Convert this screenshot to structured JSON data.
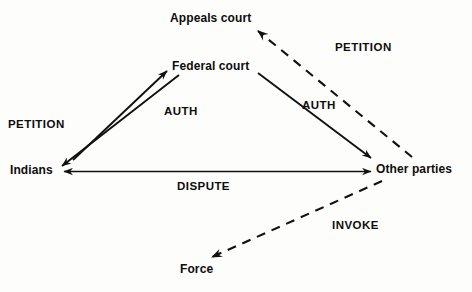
{
  "diagram": {
    "canvas": {
      "width": 472,
      "height": 292
    },
    "colors": {
      "background": "#fdfdfb",
      "ink": "#0d0d0d",
      "line": "#111111"
    },
    "nodes": [
      {
        "id": "appeals-court",
        "label": "Appeals court",
        "x": 170,
        "y": 12
      },
      {
        "id": "federal-court",
        "label": "Federal court",
        "x": 172,
        "y": 60
      },
      {
        "id": "indians",
        "label": "Indians",
        "x": 10,
        "y": 164
      },
      {
        "id": "other-parties",
        "label": "Other parties",
        "x": 376,
        "y": 163
      },
      {
        "id": "force",
        "label": "Force",
        "x": 180,
        "y": 263
      }
    ],
    "edge_labels": [
      {
        "id": "petition-left",
        "label": "PETITION",
        "x": 8,
        "y": 118
      },
      {
        "id": "auth-left",
        "label": "AUTH",
        "x": 164,
        "y": 105
      },
      {
        "id": "auth-right",
        "label": "AUTH",
        "x": 302,
        "y": 99
      },
      {
        "id": "petition-right",
        "label": "PETITION",
        "x": 335,
        "y": 41
      },
      {
        "id": "dispute",
        "label": "DISPUTE",
        "x": 177,
        "y": 180
      },
      {
        "id": "invoke",
        "label": "INVOKE",
        "x": 332,
        "y": 219
      }
    ],
    "edges": [
      {
        "id": "indians-to-federal-court",
        "from": "indians",
        "to": "federal-court",
        "style": "solid",
        "label": "PETITION",
        "arrowheads": "end"
      },
      {
        "id": "federal-court-to-indians",
        "from": "federal-court",
        "to": "indians",
        "style": "solid",
        "label": "AUTH",
        "arrowheads": "end"
      },
      {
        "id": "federal-court-to-other",
        "from": "federal-court",
        "to": "other-parties",
        "style": "solid",
        "label": "AUTH",
        "arrowheads": "end"
      },
      {
        "id": "other-to-appeals-court",
        "from": "other-parties",
        "to": "appeals-court",
        "style": "dashed",
        "label": "PETITION",
        "arrowheads": "end"
      },
      {
        "id": "indians-other-dispute",
        "from": "indians",
        "to": "other-parties",
        "style": "solid",
        "label": "DISPUTE",
        "arrowheads": "both"
      },
      {
        "id": "other-to-force",
        "from": "other-parties",
        "to": "force",
        "style": "dashed",
        "label": "INVOKE",
        "arrowheads": "end"
      }
    ]
  }
}
